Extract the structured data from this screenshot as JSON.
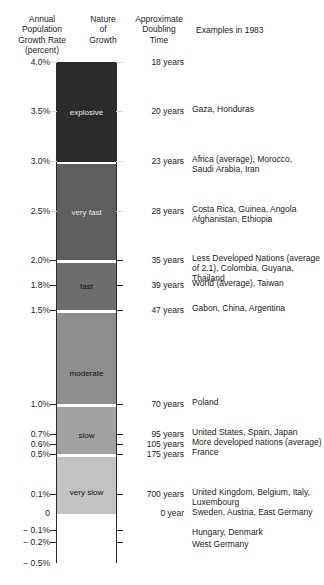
{
  "headers": {
    "rate": "Annual\nPopulation\nGrowth Rate\n(percent)",
    "nature": "Nature\nof\nGrowth",
    "doubling": "Approximate\nDoubling\nTime",
    "examples": "Examples in 1983"
  },
  "chart_data": {
    "type": "bar",
    "xlabel": "",
    "ylabel": "Annual Population Growth Rate (percent)",
    "ylim": [
      -0.5,
      4.0
    ],
    "grid": false,
    "legend": "none",
    "orientation": "vertical-single-column-segmented",
    "axis_ticks": [
      {
        "label": "4.0%",
        "value": 4.0,
        "y": 62,
        "side": "both"
      },
      {
        "label": "3.5%",
        "value": 3.5,
        "y": 111,
        "side": "both"
      },
      {
        "label": "3.0%",
        "value": 3.0,
        "y": 161,
        "side": "both"
      },
      {
        "label": "2.5%",
        "value": 2.5,
        "y": 211,
        "side": "both"
      },
      {
        "label": "2.0%",
        "value": 2.0,
        "y": 260,
        "side": "both"
      },
      {
        "label": "1.8%",
        "value": 1.8,
        "y": 285,
        "side": "both"
      },
      {
        "label": "1.5%",
        "value": 1.5,
        "y": 310,
        "side": "both"
      },
      {
        "label": "1.0%",
        "value": 1.0,
        "y": 404,
        "side": "both"
      },
      {
        "label": "0.7%",
        "value": 0.7,
        "y": 434,
        "side": "both"
      },
      {
        "label": "0.6%",
        "value": 0.6,
        "y": 444,
        "side": "both"
      },
      {
        "label": "0.5%",
        "value": 0.5,
        "y": 454,
        "side": "both"
      },
      {
        "label": "0.1%",
        "value": 0.1,
        "y": 494,
        "side": "both"
      },
      {
        "label": "0",
        "value": 0.0,
        "y": 513,
        "side": "none"
      },
      {
        "label": "− 0.1%",
        "value": -0.1,
        "y": 530,
        "side": "both"
      },
      {
        "label": "− 0.2%",
        "value": -0.2,
        "y": 542,
        "side": "both"
      },
      {
        "label": "− 0.5%",
        "value": -0.5,
        "y": 563,
        "side": "none"
      }
    ],
    "bands": [
      {
        "name": "explosive",
        "range_pct": [
          3.0,
          4.0
        ],
        "color": "#2b2b2b",
        "label_color": "light",
        "top": 62,
        "height": 99
      },
      {
        "name": "very fast",
        "range_pct": [
          2.0,
          3.0
        ],
        "color": "#5e5e5e",
        "label_color": "light",
        "top": 163,
        "height": 96
      },
      {
        "name": "fast",
        "range_pct": [
          1.5,
          2.0
        ],
        "color": "#6e6e6e",
        "label_color": "dark",
        "top": 262,
        "height": 47
      },
      {
        "name": "moderate",
        "range_pct": [
          1.0,
          1.5
        ],
        "color": "#8e8e8e",
        "label_color": "dark",
        "top": 312,
        "height": 91
      },
      {
        "name": "slow",
        "range_pct": [
          0.5,
          1.0
        ],
        "color": "#a2a2a2",
        "label_color": "dark",
        "top": 406,
        "height": 47
      },
      {
        "name": "very slow",
        "range_pct": [
          0.0,
          0.5
        ],
        "color": "#c2c2c2",
        "label_color": "dark",
        "top": 456,
        "height": 57
      },
      {
        "name": "",
        "range_pct": [
          -0.5,
          0.0
        ],
        "color": "#ffffff",
        "label_color": "dark",
        "top": 513,
        "height": 49
      }
    ],
    "band_label_positions": [
      {
        "name": "explosive",
        "y": 107
      },
      {
        "name": "very fast",
        "y": 207
      },
      {
        "name": "fast",
        "y": 281
      },
      {
        "name": "moderate",
        "y": 368
      },
      {
        "name": "slow",
        "y": 430
      },
      {
        "name": "very slow",
        "y": 487
      }
    ],
    "doubling_times": [
      {
        "label": "18 years",
        "years": 18,
        "rate_pct": 4.0,
        "y": 58
      },
      {
        "label": "20 years",
        "years": 20,
        "rate_pct": 3.5,
        "y": 107
      },
      {
        "label": "23 years",
        "years": 23,
        "rate_pct": 3.0,
        "y": 157
      },
      {
        "label": "28 years",
        "years": 28,
        "rate_pct": 2.5,
        "y": 207
      },
      {
        "label": "35 years",
        "years": 35,
        "rate_pct": 2.0,
        "y": 256
      },
      {
        "label": "39 years",
        "years": 39,
        "rate_pct": 1.8,
        "y": 281
      },
      {
        "label": "47 years",
        "years": 47,
        "rate_pct": 1.5,
        "y": 306
      },
      {
        "label": "70 years",
        "years": 70,
        "rate_pct": 1.0,
        "y": 400
      },
      {
        "label": "95 years",
        "years": 95,
        "rate_pct": 0.7,
        "y": 430
      },
      {
        "label": "105 years",
        "years": 105,
        "rate_pct": 0.6,
        "y": 440
      },
      {
        "label": "175 years",
        "years": 175,
        "rate_pct": 0.5,
        "y": 450
      },
      {
        "label": "700 years",
        "years": 700,
        "rate_pct": 0.1,
        "y": 490
      },
      {
        "label": "0 year",
        "years": 0,
        "rate_pct": 0.0,
        "y": 509
      }
    ],
    "examples": [
      {
        "text": "Gaza, Honduras",
        "rate_pct": 3.5,
        "y": 104
      },
      {
        "text": "Africa (average), Morocco,\nSaudi Arabia, Iran",
        "rate_pct": 3.0,
        "y": 154
      },
      {
        "text": "Costa Rica, Guinea, Angola\nAfghanistan, Ethiopia",
        "rate_pct": 2.5,
        "y": 204
      },
      {
        "text": "Less Developed Nations (average\nof 2.1), Colombia, Guyana, Thailand",
        "rate_pct": 2.0,
        "y": 253
      },
      {
        "text": "World (average), Taiwan",
        "rate_pct": 1.8,
        "y": 278
      },
      {
        "text": "Gabon, China, Argentina",
        "rate_pct": 1.5,
        "y": 303
      },
      {
        "text": "Poland",
        "rate_pct": 1.0,
        "y": 397
      },
      {
        "text": "United States, Spain, Japan",
        "rate_pct": 0.7,
        "y": 427
      },
      {
        "text": "More developed nations (average)",
        "rate_pct": 0.6,
        "y": 437
      },
      {
        "text": "France",
        "rate_pct": 0.5,
        "y": 447
      },
      {
        "text": "United Kingdom, Belgium, Italy,\nLuxembourg",
        "rate_pct": 0.1,
        "y": 487
      },
      {
        "text": "Sweden, Austria, East Germany",
        "rate_pct": 0.0,
        "y": 507
      },
      {
        "text": "Hungary, Denmark",
        "rate_pct": -0.1,
        "y": 527
      },
      {
        "text": "West Germany",
        "rate_pct": -0.2,
        "y": 539
      }
    ]
  },
  "colors": {
    "ink": "#1c1c1c",
    "outline": "#2a2a2a",
    "band_explosive": "#2b2b2b",
    "band_very_fast": "#5e5e5e",
    "band_fast": "#6e6e6e",
    "band_moderate": "#8e8e8e",
    "band_slow": "#a2a2a2",
    "band_very_slow": "#c2c2c2",
    "background": "#ffffff"
  }
}
